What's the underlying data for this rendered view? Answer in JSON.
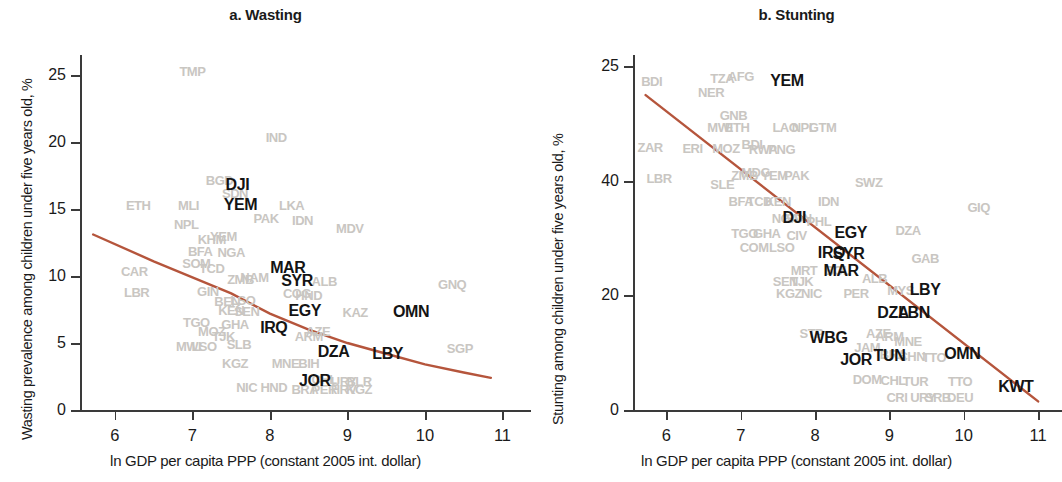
{
  "figure": {
    "axis_color": "#3a3a3a",
    "trend_color": "#b5553c",
    "label_color": "#141414",
    "faint_color": "#c9c6c2"
  },
  "panels": [
    {
      "id": "panel-a",
      "title": "a. Wasting",
      "ylabel": "Wasting prevalence among children under five years old, %",
      "xlabel": "ln GDP per capita PPP (constant 2005 int. dollar)"
    },
    {
      "id": "panel-b",
      "title": "b. Stunting",
      "ylabel": "Stunting among children under five years old, %",
      "xlabel": "ln GDP per capita PPP (constant 2005 int. dollar)"
    }
  ],
  "chart_data": [
    {
      "type": "scatter",
      "panel": "a",
      "title": "a. Wasting",
      "xlabel": "ln GDP per capita PPP (constant 2005 int. dollar)",
      "ylabel": "Wasting prevalence among children under five years old, %",
      "xlim": [
        5.55,
        11.2
      ],
      "ylim": [
        0,
        26.5
      ],
      "xticks": [
        "6",
        "7",
        "8",
        "9",
        "10",
        "11"
      ],
      "xtick_values": [
        6,
        7,
        8,
        9,
        10,
        11
      ],
      "yticks": [
        "0",
        "5",
        "10",
        "15",
        "20",
        "25"
      ],
      "ytick_values": [
        0,
        5,
        10,
        15,
        20,
        25
      ],
      "grid": false,
      "legend": "none",
      "trend_line": {
        "color": "#b5553c",
        "points": [
          [
            5.72,
            13.1
          ],
          [
            6.5,
            11.1
          ],
          [
            7.0,
            9.9
          ],
          [
            7.5,
            8.7
          ],
          [
            8.0,
            7.2
          ],
          [
            8.5,
            6.0
          ],
          [
            9.0,
            5.0
          ],
          [
            9.5,
            4.2
          ],
          [
            10.0,
            3.4
          ],
          [
            10.5,
            2.8
          ],
          [
            10.85,
            2.4
          ]
        ]
      },
      "highlighted_points": [
        {
          "label": "DJI",
          "x": 7.58,
          "y": 16.8
        },
        {
          "label": "YEM",
          "x": 7.62,
          "y": 15.3
        },
        {
          "label": "MAR",
          "x": 8.23,
          "y": 10.6
        },
        {
          "label": "SYR",
          "x": 8.35,
          "y": 9.6
        },
        {
          "label": "EGY",
          "x": 8.45,
          "y": 7.4
        },
        {
          "label": "IRQ",
          "x": 8.05,
          "y": 6.1
        },
        {
          "label": "OMN",
          "x": 9.82,
          "y": 7.3
        },
        {
          "label": "DZA",
          "x": 8.82,
          "y": 4.3
        },
        {
          "label": "LBY",
          "x": 9.52,
          "y": 4.2
        },
        {
          "label": "JOR",
          "x": 8.58,
          "y": 2.2
        }
      ],
      "faint_points": [
        {
          "label": "TMP",
          "x": 7.0,
          "y": 25.3
        },
        {
          "label": "IND",
          "x": 8.08,
          "y": 20.4
        },
        {
          "label": "BGD",
          "x": 7.35,
          "y": 17.2
        },
        {
          "label": "SDN",
          "x": 7.55,
          "y": 16.2
        },
        {
          "label": "PAK",
          "x": 7.95,
          "y": 14.3
        },
        {
          "label": "LKA",
          "x": 8.28,
          "y": 15.3
        },
        {
          "label": "IDN",
          "x": 8.42,
          "y": 14.2
        },
        {
          "label": "MDV",
          "x": 9.03,
          "y": 13.6
        },
        {
          "label": "ETH",
          "x": 6.3,
          "y": 15.3
        },
        {
          "label": "MLI",
          "x": 6.95,
          "y": 15.3
        },
        {
          "label": "NPL",
          "x": 6.92,
          "y": 13.9
        },
        {
          "label": "KHM",
          "x": 7.25,
          "y": 12.8
        },
        {
          "label": "YEM2",
          "x": 7.4,
          "y": 13.0
        },
        {
          "label": "BFA",
          "x": 7.1,
          "y": 11.9
        },
        {
          "label": "NGA",
          "x": 7.5,
          "y": 11.8
        },
        {
          "label": "SOM",
          "x": 7.05,
          "y": 11.0
        },
        {
          "label": "TCD",
          "x": 7.25,
          "y": 10.6
        },
        {
          "label": "ZMB",
          "x": 7.62,
          "y": 9.8
        },
        {
          "label": "NAM",
          "x": 7.8,
          "y": 9.9
        },
        {
          "label": "ALB",
          "x": 8.7,
          "y": 9.6
        },
        {
          "label": "GNQ",
          "x": 10.35,
          "y": 9.4
        },
        {
          "label": "CAR",
          "x": 6.25,
          "y": 10.4
        },
        {
          "label": "LBR",
          "x": 6.28,
          "y": 8.8
        },
        {
          "label": "GIN",
          "x": 7.2,
          "y": 8.9
        },
        {
          "label": "COG",
          "x": 8.35,
          "y": 8.7
        },
        {
          "label": "HND",
          "x": 8.5,
          "y": 8.6
        },
        {
          "label": "LSO",
          "x": 7.65,
          "y": 8.2
        },
        {
          "label": "BEN",
          "x": 7.45,
          "y": 8.1
        },
        {
          "label": "KEN",
          "x": 7.5,
          "y": 7.5
        },
        {
          "label": "SEN",
          "x": 7.7,
          "y": 7.4
        },
        {
          "label": "KAZ",
          "x": 9.1,
          "y": 7.3
        },
        {
          "label": "TGO",
          "x": 7.05,
          "y": 6.6
        },
        {
          "label": "GHA",
          "x": 7.55,
          "y": 6.4
        },
        {
          "label": "MOZ",
          "x": 7.25,
          "y": 5.9
        },
        {
          "label": "AZE",
          "x": 8.62,
          "y": 5.9
        },
        {
          "label": "ARM",
          "x": 8.5,
          "y": 5.5
        },
        {
          "label": "TJK",
          "x": 7.4,
          "y": 5.5
        },
        {
          "label": "MWI",
          "x": 6.95,
          "y": 4.8
        },
        {
          "label": "LSO2",
          "x": 7.15,
          "y": 4.8
        },
        {
          "label": "SLB",
          "x": 7.6,
          "y": 4.9
        },
        {
          "label": "SGP",
          "x": 10.45,
          "y": 4.6
        },
        {
          "label": "KGZ",
          "x": 7.55,
          "y": 3.5
        },
        {
          "label": "MNE",
          "x": 8.2,
          "y": 3.5
        },
        {
          "label": "BIH",
          "x": 8.5,
          "y": 3.5
        },
        {
          "label": "CHL",
          "x": 8.7,
          "y": 2.3
        },
        {
          "label": "URY",
          "x": 8.95,
          "y": 2.2
        },
        {
          "label": "BLR",
          "x": 9.15,
          "y": 2.2
        },
        {
          "label": "NIC",
          "x": 7.7,
          "y": 1.7
        },
        {
          "label": "HND2",
          "x": 8.05,
          "y": 1.7
        },
        {
          "label": "BRA",
          "x": 8.45,
          "y": 1.6
        },
        {
          "label": "PER",
          "x": 8.7,
          "y": 1.6
        },
        {
          "label": "HRV",
          "x": 8.95,
          "y": 1.6
        },
        {
          "label": "KGZ2",
          "x": 9.15,
          "y": 1.6
        }
      ]
    },
    {
      "type": "scatter",
      "panel": "b",
      "title": "b. Stunting",
      "xlabel": "ln GDP per capita PPP (constant 2005 int. dollar)",
      "ylabel": "Stunting among children under five years old, %",
      "xlim": [
        5.55,
        11.2
      ],
      "ylim": [
        0,
        62
      ],
      "xticks": [
        "6",
        "7",
        "8",
        "9",
        "10",
        "11"
      ],
      "xtick_values": [
        6,
        7,
        8,
        9,
        10,
        11
      ],
      "yticks": [
        "0",
        "20",
        "40",
        "25"
      ],
      "ytick_values": [
        0,
        20,
        40,
        60
      ],
      "grid": false,
      "legend": "none",
      "trend_line": {
        "color": "#b5553c",
        "points": [
          [
            5.72,
            55.0
          ],
          [
            11.0,
            1.5
          ]
        ]
      },
      "highlighted_points": [
        {
          "label": "YEM",
          "x": 7.62,
          "y": 57.5
        },
        {
          "label": "DJI",
          "x": 7.72,
          "y": 33.5
        },
        {
          "label": "EGY",
          "x": 8.48,
          "y": 31.0
        },
        {
          "label": "IRQ",
          "x": 8.22,
          "y": 27.5
        },
        {
          "label": "SYR",
          "x": 8.45,
          "y": 27.3
        },
        {
          "label": "MAR",
          "x": 8.35,
          "y": 24.2
        },
        {
          "label": "LBY",
          "x": 9.48,
          "y": 21.0
        },
        {
          "label": "DZA",
          "x": 9.05,
          "y": 17.0
        },
        {
          "label": "LBN",
          "x": 9.33,
          "y": 17.0
        },
        {
          "label": "WBG",
          "x": 8.18,
          "y": 12.5
        },
        {
          "label": "TUN",
          "x": 9.0,
          "y": 9.5
        },
        {
          "label": "JOR",
          "x": 8.55,
          "y": 8.8
        },
        {
          "label": "OMN",
          "x": 9.98,
          "y": 9.8
        },
        {
          "label": "KWT",
          "x": 10.7,
          "y": 4.0
        }
      ],
      "faint_points": [
        {
          "label": "BDI",
          "x": 5.8,
          "y": 57.5
        },
        {
          "label": "TZA",
          "x": 6.75,
          "y": 58.0
        },
        {
          "label": "AFG",
          "x": 7.0,
          "y": 58.3
        },
        {
          "label": "NER",
          "x": 6.6,
          "y": 55.5
        },
        {
          "label": "GNB",
          "x": 6.9,
          "y": 51.5
        },
        {
          "label": "MWI",
          "x": 6.72,
          "y": 49.5
        },
        {
          "label": "ETH",
          "x": 6.95,
          "y": 49.5
        },
        {
          "label": "LAO",
          "x": 7.6,
          "y": 49.5
        },
        {
          "label": "NPL",
          "x": 7.85,
          "y": 49.5
        },
        {
          "label": "GTM",
          "x": 8.1,
          "y": 49.5
        },
        {
          "label": "ZAR",
          "x": 5.78,
          "y": 46.0
        },
        {
          "label": "ERI",
          "x": 6.35,
          "y": 45.8
        },
        {
          "label": "MOZ",
          "x": 6.8,
          "y": 45.8
        },
        {
          "label": "BDI2",
          "x": 7.15,
          "y": 46.5
        },
        {
          "label": "RWA",
          "x": 7.3,
          "y": 45.5
        },
        {
          "label": "PNG",
          "x": 7.55,
          "y": 45.5
        },
        {
          "label": "LBR",
          "x": 5.9,
          "y": 40.5
        },
        {
          "label": "SLE",
          "x": 6.75,
          "y": 39.5
        },
        {
          "label": "ZMB",
          "x": 7.05,
          "y": 41.0
        },
        {
          "label": "MDG",
          "x": 7.2,
          "y": 41.5
        },
        {
          "label": "YEM2",
          "x": 7.45,
          "y": 41.0
        },
        {
          "label": "PAK",
          "x": 7.75,
          "y": 41.0
        },
        {
          "label": "SWZ",
          "x": 8.72,
          "y": 39.8
        },
        {
          "label": "BFA",
          "x": 7.0,
          "y": 36.5
        },
        {
          "label": "TCD",
          "x": 7.25,
          "y": 36.5
        },
        {
          "label": "KEN",
          "x": 7.5,
          "y": 36.5
        },
        {
          "label": "IDN",
          "x": 8.18,
          "y": 36.5
        },
        {
          "label": "GIQ",
          "x": 10.2,
          "y": 35.5
        },
        {
          "label": "NGA",
          "x": 7.6,
          "y": 33.5
        },
        {
          "label": "SDN",
          "x": 7.78,
          "y": 33.5
        },
        {
          "label": "PHL",
          "x": 8.05,
          "y": 33.0
        },
        {
          "label": "TGO",
          "x": 7.05,
          "y": 31.0
        },
        {
          "label": "GHA",
          "x": 7.35,
          "y": 31.0
        },
        {
          "label": "DZA2",
          "x": 9.25,
          "y": 31.5
        },
        {
          "label": "CIV",
          "x": 7.75,
          "y": 30.5
        },
        {
          "label": "COM",
          "x": 7.18,
          "y": 28.5
        },
        {
          "label": "LSO",
          "x": 7.55,
          "y": 28.5
        },
        {
          "label": "MRT",
          "x": 7.85,
          "y": 24.5
        },
        {
          "label": "BOL",
          "x": 8.3,
          "y": 24.5
        },
        {
          "label": "GAB",
          "x": 9.48,
          "y": 26.5
        },
        {
          "label": "SEN",
          "x": 7.6,
          "y": 22.5
        },
        {
          "label": "TJK",
          "x": 7.82,
          "y": 22.5
        },
        {
          "label": "ALB",
          "x": 8.8,
          "y": 23.0
        },
        {
          "label": "KGZ",
          "x": 7.65,
          "y": 20.5
        },
        {
          "label": "NIC",
          "x": 7.95,
          "y": 20.5
        },
        {
          "label": "PER",
          "x": 8.55,
          "y": 20.5
        },
        {
          "label": "MYS",
          "x": 9.15,
          "y": 21.0
        },
        {
          "label": "STP",
          "x": 7.95,
          "y": 13.5
        },
        {
          "label": "AZE",
          "x": 8.85,
          "y": 13.5
        },
        {
          "label": "ARM",
          "x": 9.0,
          "y": 13.0
        },
        {
          "label": "MNE",
          "x": 9.25,
          "y": 12.0
        },
        {
          "label": "JAM",
          "x": 8.7,
          "y": 11.0
        },
        {
          "label": "BRA",
          "x": 9.05,
          "y": 9.8
        },
        {
          "label": "CHN",
          "x": 9.3,
          "y": 9.5
        },
        {
          "label": "TTO",
          "x": 9.6,
          "y": 9.2
        },
        {
          "label": "DOM",
          "x": 8.7,
          "y": 5.5
        },
        {
          "label": "CHL",
          "x": 9.05,
          "y": 5.2
        },
        {
          "label": "TUR",
          "x": 9.35,
          "y": 5.0
        },
        {
          "label": "TTO2",
          "x": 9.95,
          "y": 5.0
        },
        {
          "label": "CRI",
          "x": 9.1,
          "y": 2.2
        },
        {
          "label": "URY",
          "x": 9.45,
          "y": 2.2
        },
        {
          "label": "DEU",
          "x": 9.95,
          "y": 2.2
        },
        {
          "label": "SRB",
          "x": 9.65,
          "y": 2.2
        }
      ]
    }
  ]
}
